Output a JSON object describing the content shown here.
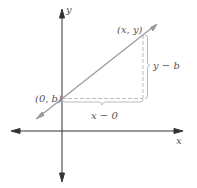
{
  "diagram": {
    "axes": {
      "x_label": "x",
      "y_label": "y",
      "color": "#333333"
    },
    "line": {
      "color": "#9a9a9a"
    },
    "points": {
      "intercept_label": "(0, b)",
      "point_label": "(x, y)"
    },
    "braces": {
      "vertical_label": "y − b",
      "horizontal_label": "x − 0",
      "color": "#bbbbbb"
    }
  }
}
